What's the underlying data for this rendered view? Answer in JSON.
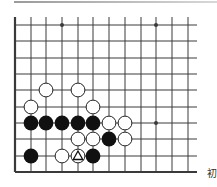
{
  "diagram": {
    "type": "go-board-problem",
    "colors": {
      "background": "#ffffff",
      "grid_line": "#3a3a3a",
      "black_stone": "#111111",
      "white_stone_fill": "#ffffff",
      "white_stone_stroke": "#222222",
      "mark": "#111111"
    },
    "grid": {
      "x_lines": [
        15,
        31,
        46,
        62,
        78,
        93,
        109,
        125,
        141,
        156,
        172,
        188
      ],
      "y_lines": [
        25,
        41,
        58,
        74,
        90,
        107,
        123,
        139,
        156,
        172
      ],
      "right_extent": 197,
      "top_extent": 17,
      "left_edge_thick": true,
      "bottom_edge_thick": true
    },
    "star_points": [
      {
        "col": 3,
        "row": 0
      },
      {
        "col": 9,
        "row": 0
      },
      {
        "col": 9,
        "row": 6
      }
    ],
    "stones": [
      {
        "color": "white",
        "col": 2,
        "row": 4
      },
      {
        "color": "white",
        "col": 4,
        "row": 4
      },
      {
        "color": "white",
        "col": 1,
        "row": 5
      },
      {
        "color": "white",
        "col": 5,
        "row": 5
      },
      {
        "color": "black",
        "col": 1,
        "row": 6
      },
      {
        "color": "black",
        "col": 2,
        "row": 6
      },
      {
        "color": "black",
        "col": 3,
        "row": 6
      },
      {
        "color": "black",
        "col": 4,
        "row": 6
      },
      {
        "color": "black",
        "col": 5,
        "row": 6
      },
      {
        "color": "white",
        "col": 6,
        "row": 6
      },
      {
        "color": "white",
        "col": 7,
        "row": 6
      },
      {
        "color": "white",
        "col": 4,
        "row": 7
      },
      {
        "color": "white",
        "col": 5,
        "row": 7
      },
      {
        "color": "black",
        "col": 6,
        "row": 7
      },
      {
        "color": "white",
        "col": 7,
        "row": 7
      },
      {
        "color": "black",
        "col": 1,
        "row": 8
      },
      {
        "color": "white",
        "col": 3,
        "row": 8
      },
      {
        "color": "white",
        "col": 4,
        "row": 8,
        "mark": "triangle"
      },
      {
        "color": "black",
        "col": 5,
        "row": 8
      }
    ]
  },
  "caption": {
    "line1": "初",
    "line2": "级"
  }
}
